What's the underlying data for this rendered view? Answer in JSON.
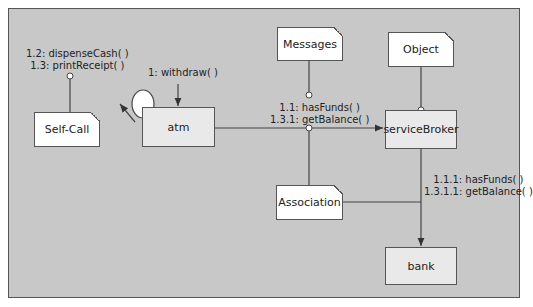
{
  "objects": {
    "atm": "atm",
    "serviceBroker": "serviceBroker",
    "bank": "bank"
  },
  "notes": {
    "self_call": "Self-Call",
    "messages": "Messages",
    "object": "Object",
    "association": "Association"
  },
  "messages": {
    "withdraw": "1: withdraw( )",
    "self_1": "1.2: dispenseCash( )",
    "self_2": "1.3: printReceipt( )",
    "broker_1": "1.1: hasFunds( )",
    "broker_2": "1.3.1: getBalance( )",
    "bank_1": "1.1.1: hasFunds( )",
    "bank_2": "1.3.1.1: getBalance( )"
  },
  "colors": {
    "background": "#c8c8c8",
    "object_fill": "#e9e9e9",
    "note_fill": "#ffffff",
    "line": "#444444"
  }
}
